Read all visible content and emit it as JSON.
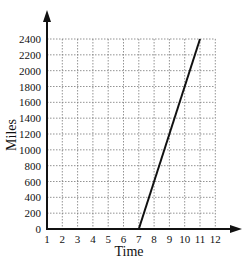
{
  "chart_data": {
    "type": "line",
    "title": "",
    "xlabel": "Time",
    "ylabel": "Miles",
    "x_ticks": [
      "1",
      "2",
      "3",
      "4",
      "5",
      "6",
      "7",
      "8",
      "9",
      "10",
      "11",
      "12"
    ],
    "y_ticks": [
      "0",
      "200",
      "400",
      "600",
      "800",
      "1000",
      "1200",
      "1400",
      "1600",
      "1800",
      "2000",
      "2200",
      "2400"
    ],
    "xlim": [
      1,
      12
    ],
    "ylim": [
      0,
      2400
    ],
    "grid": "dotted",
    "legend": null,
    "series": [
      {
        "name": "distance",
        "x": [
          7,
          11
        ],
        "y": [
          0,
          2400
        ],
        "color": "#111111"
      }
    ]
  }
}
